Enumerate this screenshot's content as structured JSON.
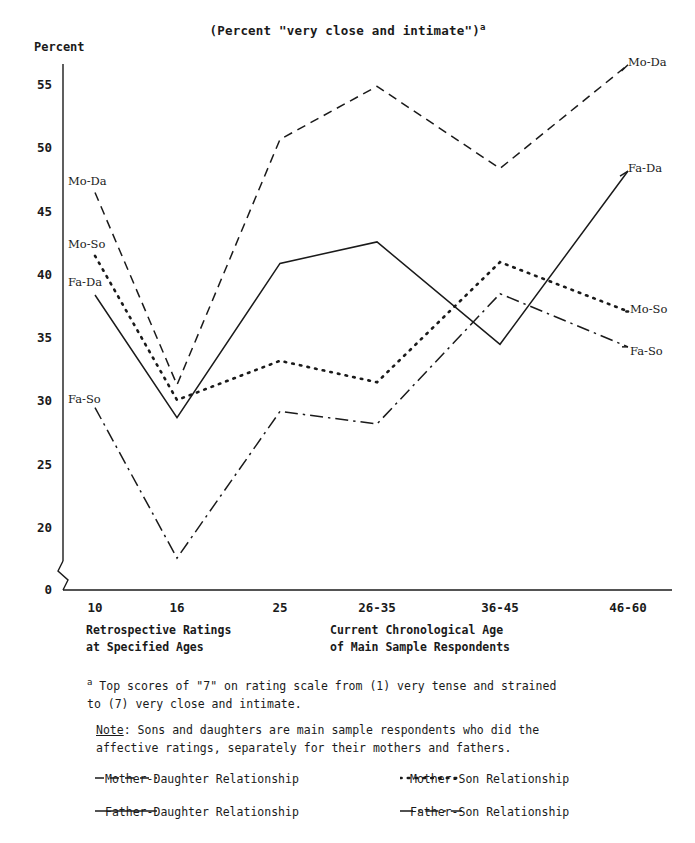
{
  "chart_data": {
    "type": "line",
    "title": "(Percent \"very close and intimate\")",
    "title_sup": "a",
    "ylabel": "Percent",
    "xlabel_left": "Retrospective Ratings\nat Specified Ages",
    "xlabel_right": "Current Chronological Age\nof Main Sample Respondents",
    "categories": [
      "10",
      "16",
      "25",
      "26-35",
      "36-45",
      "46-60"
    ],
    "yticks": [
      0,
      20,
      25,
      30,
      35,
      40,
      45,
      50,
      55
    ],
    "ylim": [
      17,
      57
    ],
    "axis_break": true,
    "grid": false,
    "legend_position": "bottom",
    "series": [
      {
        "name": "Mother-Daughter Relationship",
        "short": "Mo-Da",
        "style": "dashed",
        "values": [
          46.5,
          31.3,
          50.7,
          54.9,
          48.4,
          56.6
        ]
      },
      {
        "name": "Mother-Son Relationship",
        "short": "Mo-So",
        "style": "dotted",
        "values": [
          41.5,
          30.1,
          33.2,
          31.5,
          41.0,
          37.1
        ]
      },
      {
        "name": "Father-Daughter Relationship",
        "short": "Fa-Da",
        "style": "solid",
        "values": [
          38.4,
          28.7,
          40.9,
          42.6,
          34.5,
          48.2
        ]
      },
      {
        "name": "Father-Son Relationship",
        "short": "Fa-So",
        "style": "dashdot",
        "values": [
          29.5,
          17.6,
          29.2,
          28.2,
          38.5,
          34.3
        ]
      }
    ],
    "left_labels": [
      "Mo-Da",
      "Mo-So",
      "Fa-Da",
      "Fa-So"
    ],
    "right_labels": [
      "Mo-Da",
      "Fa-Da",
      "Mo-So",
      "Fa-So"
    ]
  },
  "footnote": {
    "marker": "a",
    "text": "Top scores of \"7\" on rating scale from (1) very tense and strained\nto (7) very close and intimate."
  },
  "note": {
    "label": "Note",
    "text": ": Sons and daughters are main sample respondents who did the\naffective ratings, separately for their mothers and fathers."
  },
  "legend": {
    "items": [
      {
        "label": "Mother-Daughter Relationship",
        "style": "dashed"
      },
      {
        "label": "Mother-Son Relationship",
        "style": "dotted"
      },
      {
        "label": "Father-Daughter Relationship",
        "style": "solid"
      },
      {
        "label": "Father-Son Relationship",
        "style": "dashdot"
      }
    ]
  },
  "colors": {
    "ink": "#1a1a1a",
    "background": "#ffffff"
  }
}
